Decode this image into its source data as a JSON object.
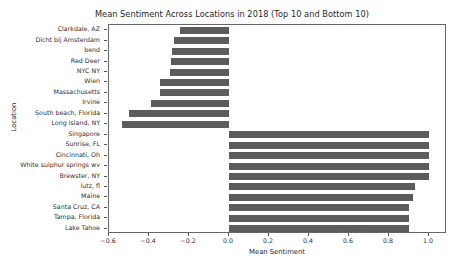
{
  "chart_data": {
    "type": "bar",
    "orientation": "horizontal",
    "title": "Mean Sentiment Across Locations in 2018 (Top 10 and Bottom 10)",
    "xlabel": "Mean Sentiment",
    "ylabel": "Location",
    "xlim": [
      -0.65,
      1.09
    ],
    "ylim_note": "20 categories, top to bottom",
    "grid": false,
    "legend": null,
    "bar_color": "#5c5c5c",
    "xticks": [
      -0.6,
      -0.4,
      -0.2,
      0.0,
      0.2,
      0.4,
      0.6,
      0.8,
      1.0
    ],
    "xticklabels": [
      "-0.6",
      "-0.4",
      "-0.2",
      "0.0",
      "0.2",
      "0.4",
      "0.6",
      "0.8",
      "1.0"
    ],
    "categories": [
      "Clarkdale, AZ",
      "Dicht bij Amsterdam",
      "bend",
      "Red Deer",
      "NYC NY",
      "Wien",
      "Massachusetts",
      "Irvine",
      "South beach, Florida",
      "Long Island, NY",
      "Singapore",
      "Sunrise, FL",
      "Cincinnati, Oh",
      "White sulphur springs wv",
      "Brewster, NY",
      "lutz, fl",
      "Maine",
      "Santa Cruz, CA",
      "Tampa, Florida",
      "Lake Tahoe"
    ],
    "values": [
      -0.245,
      -0.275,
      -0.285,
      -0.29,
      -0.295,
      -0.345,
      -0.345,
      -0.39,
      -0.5,
      -0.535,
      1.0,
      1.0,
      1.0,
      1.0,
      1.0,
      0.93,
      0.92,
      0.9,
      0.9,
      0.9
    ]
  }
}
